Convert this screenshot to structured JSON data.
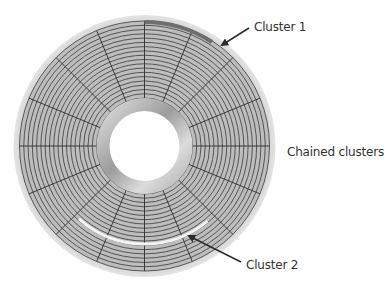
{
  "diagram": {
    "labels": {
      "cluster1": "Cluster 1",
      "chained": "Chained clusters",
      "cluster2": "Cluster 2"
    },
    "disc": {
      "center": [
        144.5,
        146
      ],
      "outer_radius": 131,
      "track_outer_radius": 125,
      "track_inner_radius": 48,
      "hub_radius": 48,
      "hole_radius": 35,
      "track_count": 18,
      "sector_count": 16
    },
    "highlights": {
      "cluster1": {
        "radius": 124,
        "start_deg": -90,
        "end_deg": -57,
        "color": "#6e6e6e"
      },
      "cluster2": {
        "radius": 98,
        "start_deg": 50,
        "end_deg": 132,
        "color": "#f4f4f4"
      }
    },
    "arrows": [
      {
        "name": "cluster1-arrow",
        "from": [
          249,
          28
        ],
        "to": [
          222,
          45
        ]
      },
      {
        "name": "cluster2-arrow",
        "from": [
          241,
          262
        ],
        "to": [
          189,
          236
        ]
      }
    ],
    "colors": {
      "disc_rim": "#d6d6d6",
      "track_fill": "#bdbdbd",
      "track_line": "#3a3a3a",
      "hub": "#cfcfcf",
      "text": "#333333"
    }
  }
}
